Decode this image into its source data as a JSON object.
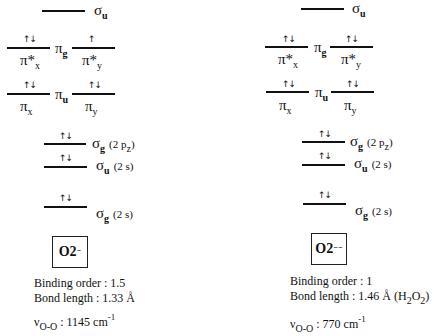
{
  "diagram_type": "molecular orbital energy level diagram",
  "panels": [
    {
      "species_label": "O2",
      "species_charge": "⁻",
      "levels": {
        "sigma_u_star": {
          "symbol": "σ",
          "sub": "u",
          "electrons": ""
        },
        "pi_g": {
          "symbol": "π",
          "sub": "g",
          "left": {
            "label": "π*",
            "sub": "x",
            "electrons": "↑↓"
          },
          "right": {
            "label": "π*",
            "sub": "y",
            "electrons": "↑"
          }
        },
        "pi_u": {
          "symbol": "π",
          "sub": "u",
          "left": {
            "label": "π",
            "sub": "x",
            "electrons": "↑↓"
          },
          "right": {
            "label": "π",
            "sub": "y",
            "electrons": "↑↓"
          }
        },
        "sigma_g_2pz": {
          "symbol": "σ",
          "sub": "g",
          "note": "(2 p",
          "note_sub": "z",
          "note_end": ")",
          "electrons": "↑↓"
        },
        "sigma_u_2s": {
          "symbol": "σ",
          "sub": "u",
          "note": "(2 s)",
          "electrons": "↑↓"
        },
        "sigma_g_2s": {
          "symbol": "σ",
          "sub": "g",
          "note": "(2 s)",
          "electrons": "↑↓"
        }
      },
      "info": {
        "binding_order": "Binding order : 1.5",
        "bond_length": "Bond length : 1.33 Å",
        "nu_symbol": "ν",
        "nu_sub": "O-O",
        "nu_value": " : 1145 cm",
        "nu_exp": "-1"
      }
    },
    {
      "species_label": "O2",
      "species_charge": "⁻⁻",
      "levels": {
        "sigma_u_star": {
          "symbol": "σ",
          "sub": "u",
          "electrons": ""
        },
        "pi_g": {
          "symbol": "π",
          "sub": "g",
          "left": {
            "label": "π*",
            "sub": "x",
            "electrons": "↑↓"
          },
          "right": {
            "label": "π*",
            "sub": "y",
            "electrons": "↑↓"
          }
        },
        "pi_u": {
          "symbol": "π",
          "sub": "u",
          "left": {
            "label": "π",
            "sub": "x",
            "electrons": "↑↓"
          },
          "right": {
            "label": "π",
            "sub": "y",
            "electrons": "↑↓"
          }
        },
        "sigma_g_2pz": {
          "symbol": "σ",
          "sub": "g",
          "note": "(2 p",
          "note_sub": "z",
          "note_end": ")",
          "electrons": "↑↓"
        },
        "sigma_u_2s": {
          "symbol": "σ",
          "sub": "u",
          "note": "(2 s)",
          "electrons": "↑↓"
        },
        "sigma_g_2s": {
          "symbol": "σ",
          "sub": "g",
          "note": "(2 s)",
          "electrons": "↑↓"
        }
      },
      "info": {
        "binding_order": "Binding order : 1",
        "bond_length": "Bond length : 1.46 Å (H",
        "bond_length_sub1": "2",
        "bond_length_mid": "O",
        "bond_length_sub2": "2",
        "bond_length_end": ")",
        "nu_symbol": "ν",
        "nu_sub": "O-O",
        "nu_value": " : 770 cm",
        "nu_exp": "-1"
      }
    }
  ]
}
